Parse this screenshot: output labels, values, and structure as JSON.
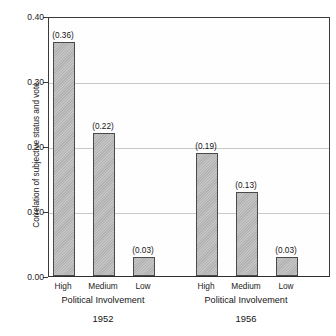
{
  "chart_data": {
    "type": "bar",
    "title": "",
    "xlabel": "Political Involvement",
    "ylabel": "Correlation of subjective status and vote",
    "ylim": [
      0.0,
      0.4
    ],
    "ytick_labels": [
      "0.00",
      "0.10",
      "0.20",
      "0.30",
      "0.40"
    ],
    "ytick_values": [
      0.0,
      0.1,
      0.2,
      0.3,
      0.4
    ],
    "grid": "horizontal",
    "legend": "none",
    "categories": [
      "High",
      "Medium",
      "Low"
    ],
    "groups": [
      {
        "name": "1952",
        "axis_title": "Political Involvement",
        "categories": [
          "High",
          "Medium",
          "Low"
        ],
        "values": [
          0.36,
          0.22,
          0.03
        ],
        "value_labels": [
          "(0.36)",
          "(0.22)",
          "(0.03)"
        ]
      },
      {
        "name": "1956",
        "axis_title": "Political Involvement",
        "categories": [
          "High",
          "Medium",
          "Low"
        ],
        "values": [
          0.19,
          0.13,
          0.03
        ],
        "value_labels": [
          "(0.19)",
          "(0.13)",
          "(0.03)"
        ]
      }
    ],
    "series": [
      {
        "name": "1952",
        "values": [
          0.36,
          0.22,
          0.03
        ]
      },
      {
        "name": "1956",
        "values": [
          0.19,
          0.13,
          0.03
        ]
      }
    ],
    "colors": {
      "bar_fill": "#b9b9b9",
      "bar_border": "#4a4a4a",
      "axis": "#3a3a3a",
      "gridline": "#c9c9c9",
      "text": "#1a1a1a",
      "background": "#ffffff"
    }
  },
  "caption": {
    "clipped_text": ""
  }
}
